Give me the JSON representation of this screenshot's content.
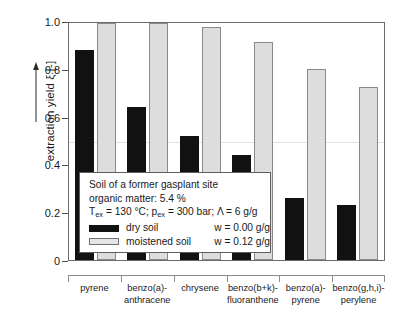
{
  "chart_data": {
    "type": "bar",
    "title": "",
    "xlabel": "",
    "ylabel": "extraction yield ξ [-]",
    "ylim": [
      0,
      1.0
    ],
    "yticks": [
      "0",
      "0.2",
      "0.4",
      "0.6",
      "0.8",
      "1.0"
    ],
    "grid": "single faint horizontal gridline at 0.5",
    "legend_position": "inside plot, lower-left",
    "categories": [
      "pyrene",
      "benzo(a)-anthracene",
      "chrysene",
      "benzo(b+k)-fluoranthene",
      "benzo(a)-pyrene",
      "benzo(g,h,i)-perylene"
    ],
    "category_lines": [
      [
        "pyrene",
        ""
      ],
      [
        "benzo(a)-",
        "anthracene"
      ],
      [
        "chrysene",
        ""
      ],
      [
        "benzo(b+k)-",
        "fluoranthene"
      ],
      [
        "benzo(a)-",
        "pyrene"
      ],
      [
        "benzo(g,h,i)-",
        "perylene"
      ]
    ],
    "series": [
      {
        "name": "dry soil",
        "color": "#111111",
        "values": [
          0.885,
          0.645,
          0.522,
          0.445,
          0.262,
          0.232
        ]
      },
      {
        "name": "moistened soil",
        "color": "#dddddd",
        "values": [
          1.0,
          1.0,
          0.985,
          0.918,
          0.808,
          0.728
        ]
      }
    ]
  },
  "yaxis": {
    "label": "extraction yield ξ [-]",
    "ticks": [
      "1.0",
      "0.8",
      "0.6",
      "0.4",
      "0.2",
      "0"
    ]
  },
  "legend": {
    "line1": "Soil of a former gasplant site",
    "line2": "organic matter:  5.4 %",
    "line3_t": "T",
    "line3_t_sub": "ex",
    "line3_mid": " = 130 °C;  p",
    "line3_p_sub": "ex",
    "line3_end": " = 300 bar;  Λ = 6 g/g",
    "dry_label": "dry soil",
    "dry_w": "w = 0.00 g/g",
    "moist_label": "moistened soil",
    "moist_w": "w = 0.12 g/g"
  }
}
